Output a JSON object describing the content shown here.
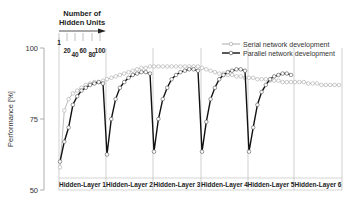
{
  "chart_data": {
    "type": "line",
    "title": "",
    "xlabel": "",
    "ylabel": "Performance [%]",
    "ylim": [
      50,
      100
    ],
    "yticks": [
      50,
      75,
      100
    ],
    "grid": false,
    "legend_position": "top-right",
    "legend": [
      "Serial network development",
      "Parallel network development"
    ],
    "inset_annotation": {
      "title_line1": "Number of",
      "title_line2": "Hidden Units",
      "ticks": [
        "1",
        "20",
        "40",
        "60",
        "80",
        "100"
      ]
    },
    "panels": [
      "Hidden-Layer 1",
      "Hidden-Layer 2",
      "Hidden-Layer 3",
      "Hidden-Layer 4",
      "Hidden-Layer 5",
      "Hidden-Layer 6"
    ],
    "x": [
      1,
      10,
      20,
      30,
      40,
      50,
      60,
      70,
      80,
      90,
      100
    ],
    "series": [
      {
        "name": "Serial network development",
        "color": "#aaaaaa",
        "panels": [
          [
            58,
            78,
            82,
            84,
            85,
            86,
            87,
            87.5,
            88,
            88,
            88.5
          ],
          [
            89,
            89.5,
            90,
            90.5,
            91,
            91.5,
            92,
            92.5,
            93,
            93,
            93.5
          ],
          [
            93.5,
            93.5,
            93.5,
            93.5,
            93.5,
            93.5,
            93.5,
            93.5,
            93.5,
            93.5,
            93.5
          ],
          [
            93,
            92.5,
            92,
            91.5,
            91,
            91,
            90.5,
            90.5,
            90,
            90,
            89.5
          ],
          [
            89.5,
            89.5,
            89,
            89,
            89,
            88.5,
            88.5,
            88.5,
            88,
            88,
            88
          ],
          [
            88,
            88,
            88,
            87.5,
            87.5,
            87.5,
            87,
            87,
            87,
            87,
            87
          ]
        ]
      },
      {
        "name": "Parallel network development",
        "color": "#111111",
        "panels": [
          [
            60,
            67,
            72,
            80,
            83,
            85,
            86,
            87,
            87.5,
            88,
            87.5
          ],
          [
            62.5,
            75,
            82,
            86,
            88,
            89.5,
            90.5,
            91,
            91.5,
            91.5,
            91
          ],
          [
            63.5,
            75,
            82,
            86,
            89,
            90.5,
            91.5,
            92,
            92.5,
            92.5,
            92
          ],
          [
            63.5,
            74,
            82,
            86,
            89,
            90.5,
            91.5,
            92,
            92.5,
            92.5,
            92
          ],
          [
            63.5,
            72,
            80,
            84.5,
            87,
            89,
            90,
            90.5,
            91,
            91,
            90.5
          ],
          [
            null,
            null,
            null,
            null,
            null,
            null,
            null,
            null,
            null,
            null,
            null
          ]
        ]
      }
    ]
  }
}
